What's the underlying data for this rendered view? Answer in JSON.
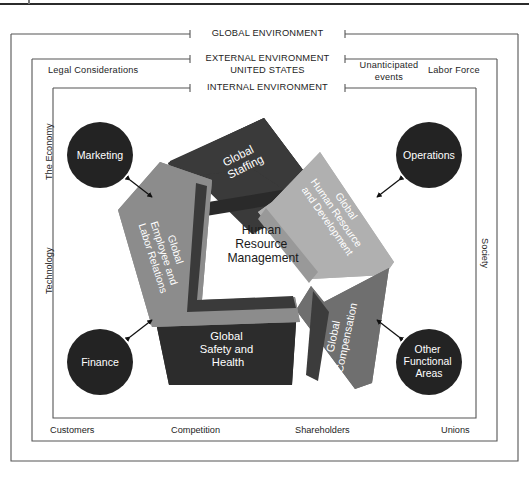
{
  "figure": {
    "center": {
      "line1": "Human",
      "line2": "Resource",
      "line3": "Management"
    }
  },
  "frames": {
    "outer": {
      "label": "GLOBAL ENVIRONMENT"
    },
    "middle": {
      "label_line1": "EXTERNAL ENVIRONMENT",
      "label_line2": "UNITED STATES"
    },
    "inner": {
      "label": "INTERNAL ENVIRONMENT"
    }
  },
  "environment_factors": {
    "top_left": "Legal Considerations",
    "top_right_a_line1": "Unanticipated",
    "top_right_a_line2": "events",
    "top_right_b": "Labor Force",
    "left_upper": "The Economy",
    "left_lower": "Technology",
    "right": "Society",
    "bottom": [
      "Customers",
      "Competition",
      "Shareholders",
      "Unions"
    ]
  },
  "functional_areas": [
    {
      "id": "marketing",
      "label": "Marketing",
      "lines": [
        "Marketing"
      ]
    },
    {
      "id": "operations",
      "label": "Operations",
      "lines": [
        "Operations"
      ]
    },
    {
      "id": "finance",
      "label": "Finance",
      "lines": [
        "Finance"
      ]
    },
    {
      "id": "other-functional-areas",
      "label": "Other Functional Areas",
      "lines": [
        "Other",
        "Functional",
        "Areas"
      ]
    }
  ],
  "hr_segments": [
    {
      "id": "global-staffing",
      "lines": [
        "Global",
        "Staffing"
      ],
      "color": "#3a3a3a",
      "text_color": "#ffffff"
    },
    {
      "id": "global-human-resource-and-development",
      "lines": [
        "Global",
        "Human Resource",
        "and Development"
      ],
      "color": "#b0b0b0",
      "text_color": "#ffffff"
    },
    {
      "id": "global-compensation",
      "lines": [
        "Global",
        "Compensation"
      ],
      "color": "#6f6f6f",
      "text_color": "#ffffff"
    },
    {
      "id": "global-safety-and-health",
      "lines": [
        "Global",
        "Safety and",
        "Health"
      ],
      "color": "#2c2c2c",
      "text_color": "#ffffff"
    },
    {
      "id": "global-employee-and-labor-relations",
      "lines": [
        "Global",
        "Employee and",
        "Labor Relations"
      ],
      "color": "#8c8c8c",
      "text_color": "#ffffff"
    }
  ],
  "colors": {
    "circle_fill": "#232323",
    "circle_text": "#ffffff",
    "frame_stroke": "#555555",
    "page_background": "#ffffff",
    "center_text": "#1a1a1a"
  }
}
